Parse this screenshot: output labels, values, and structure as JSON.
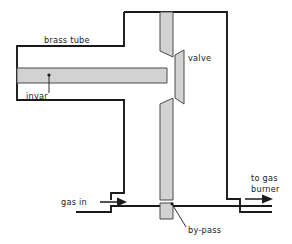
{
  "diagram": {
    "labels": {
      "brass_tube": "brass tube",
      "invar": "invar",
      "valve": "valve",
      "by_pass": "by-pass",
      "gas_in": "gas in",
      "to_gas_burner_line1": "to gas",
      "to_gas_burner_line2": "burner"
    },
    "colors": {
      "outline": "#1a1a1a",
      "metal_fill": "#d2d2d2",
      "metal_stroke": "#4a4a4a",
      "background": "#ffffff"
    },
    "parts": [
      {
        "name": "brass-tube",
        "kind": "housing"
      },
      {
        "name": "invar-rod",
        "kind": "metal-bar"
      },
      {
        "name": "valve-disc",
        "kind": "trapezoid"
      },
      {
        "name": "upper-valve-seat",
        "kind": "metal-bar"
      },
      {
        "name": "lower-valve-seat",
        "kind": "metal-bar"
      },
      {
        "name": "by-pass-block",
        "kind": "metal-bar"
      }
    ],
    "flow": [
      {
        "name": "gas-in",
        "direction": "right"
      },
      {
        "name": "to-gas-burner",
        "direction": "right"
      }
    ]
  }
}
